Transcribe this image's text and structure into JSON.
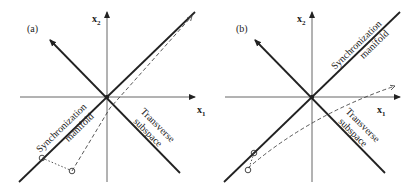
{
  "panels": [
    {
      "label": "(a)",
      "axis_x": "x",
      "axis_x_sub": "1",
      "axis_y": "x",
      "axis_y_sub": "2",
      "manifold_line1": "Synchronization",
      "manifold_line2": "manifold",
      "transverse_line1": "Transverse",
      "transverse_line2": "subspace"
    },
    {
      "label": "(b)",
      "axis_x": "x",
      "axis_x_sub": "1",
      "axis_y": "x",
      "axis_y_sub": "2",
      "manifold_line1": "Synchronization",
      "manifold_line2": "manifold",
      "transverse_line1": "Transverse",
      "transverse_line2": "subspace"
    }
  ],
  "colors": {
    "line": "#222222",
    "axis": "#555555"
  }
}
